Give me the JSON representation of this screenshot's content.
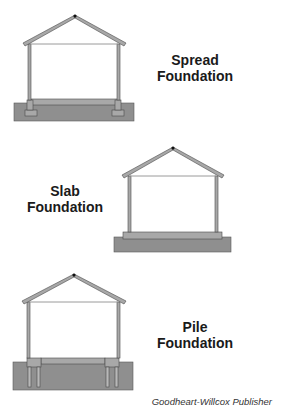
{
  "figures": [
    {
      "id": "spread",
      "label_line1": "Spread",
      "label_line2": "Foundation"
    },
    {
      "id": "slab",
      "label_line1": "Slab",
      "label_line2": "Foundation"
    },
    {
      "id": "pile",
      "label_line1": "Pile",
      "label_line2": "Foundation"
    }
  ],
  "credit": "Goodheart-Willcox Publisher",
  "colors": {
    "ground": "#8f8f8f",
    "structure": "#a8a8a8",
    "outline": "#4a4a4a",
    "ceiling_line": "#9a9a9a"
  }
}
